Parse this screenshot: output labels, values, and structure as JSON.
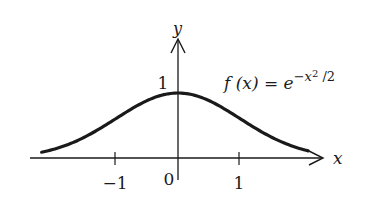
{
  "chart_data": {
    "type": "line",
    "title": "",
    "function_label": "f(x) = e^{-x^2/2}",
    "function_label_parts": {
      "lhs": "f (x) = e",
      "exp": "−x",
      "exp_pow": "2",
      "exp_tail": " /2"
    },
    "xlabel": "x",
    "ylabel": "y",
    "xlim": [
      -2.2,
      2.1
    ],
    "ylim": [
      0,
      1
    ],
    "grid": false,
    "legend": "none",
    "x_ticks": [
      {
        "value": -1,
        "label": "−1"
      },
      {
        "value": 0,
        "label": "0"
      },
      {
        "value": 1,
        "label": "1"
      }
    ],
    "y_ticks": [
      {
        "value": 1,
        "label": "1"
      }
    ],
    "series": [
      {
        "name": "f(x) = e^{-x^2/2}",
        "x": [
          -2.2,
          -2.0,
          -1.5,
          -1.0,
          -0.5,
          0,
          0.5,
          1.0,
          1.5,
          2.0,
          2.1
        ],
        "values": [
          0.089,
          0.135,
          0.325,
          0.607,
          0.882,
          1.0,
          0.882,
          0.607,
          0.325,
          0.135,
          0.11
        ]
      }
    ]
  },
  "colors": {
    "ink": "#1a1a1a",
    "background": "#ffffff"
  }
}
